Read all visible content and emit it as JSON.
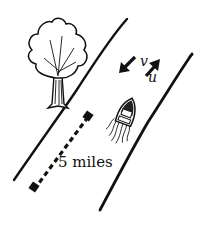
{
  "diagram": {
    "labels": {
      "distance": "5 miles",
      "current_velocity": "v",
      "boat_velocity": "u"
    },
    "elements": {
      "left_bank": "river-bank",
      "right_bank": "river-bank",
      "tree": "tree",
      "boat": "motorboat",
      "distance_marker": "dashed-line",
      "current_arrow": "arrow-down-left",
      "boat_arrow": "arrow-up-right"
    },
    "colors": {
      "ink": "#111111",
      "background": "#ffffff"
    }
  }
}
